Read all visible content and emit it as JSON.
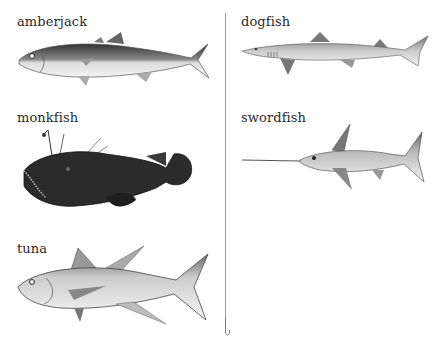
{
  "fish": [
    {
      "id": "amberjack",
      "label": "amberjack"
    },
    {
      "id": "dogfish",
      "label": "dogfish"
    },
    {
      "id": "monkfish",
      "label": "monkfish"
    },
    {
      "id": "swordfish",
      "label": "swordfish"
    },
    {
      "id": "tuna",
      "label": "tuna"
    }
  ],
  "colors": {
    "ink": "#2a2a2a",
    "line": "#9a9a9a"
  }
}
